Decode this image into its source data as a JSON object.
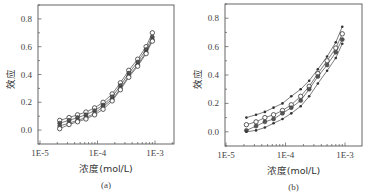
{
  "figure": {
    "panels": [
      {
        "caption": "(a)",
        "xlabel": "浓度(mol/L)",
        "ylabel": "效应"
      },
      {
        "caption": "(b)",
        "xlabel": "浓度(mol/L)",
        "ylabel": "效应"
      }
    ]
  },
  "chart_data": [
    {
      "type": "line",
      "title": "",
      "caption": "(a)",
      "xlabel": "浓度(mol/L)",
      "ylabel": "效应",
      "xscale": "log",
      "xlim": [
        1e-05,
        0.0017
      ],
      "ylim": [
        -0.1,
        0.9
      ],
      "xticks": [
        "1E-5",
        "1E-4",
        "1E-3"
      ],
      "yticks": [
        "0.0",
        "0.2",
        "0.4",
        "0.6",
        "0.8"
      ],
      "grid": false,
      "legend": null,
      "x": [
        2.2e-05,
        3.2e-05,
        4.5e-05,
        6.3e-05,
        8.9e-05,
        0.000125,
        0.00018,
        0.00025,
        0.00035,
        0.0005,
        0.0007,
        0.0009
      ],
      "series": [
        {
          "name": "curve 1 (open circles, upper)",
          "marker": "open-circle",
          "values": [
            0.07,
            0.09,
            0.11,
            0.13,
            0.16,
            0.2,
            0.26,
            0.34,
            0.43,
            0.51,
            0.6,
            0.7
          ]
        },
        {
          "name": "curve 2",
          "marker": "filled-circle",
          "values": [
            0.05,
            0.07,
            0.09,
            0.11,
            0.14,
            0.18,
            0.24,
            0.32,
            0.41,
            0.49,
            0.58,
            0.67
          ]
        },
        {
          "name": "curve 3",
          "marker": "filled-circle",
          "values": [
            0.03,
            0.05,
            0.07,
            0.09,
            0.12,
            0.17,
            0.22,
            0.3,
            0.39,
            0.47,
            0.56,
            0.65
          ]
        },
        {
          "name": "curve 4 (lower)",
          "marker": "open-circle",
          "values": [
            0.01,
            0.04,
            0.06,
            0.08,
            0.11,
            0.15,
            0.21,
            0.29,
            0.38,
            0.46,
            0.55,
            0.64
          ]
        }
      ]
    },
    {
      "type": "line",
      "title": "",
      "caption": "(b)",
      "xlabel": "浓度(mol/L)",
      "ylabel": "效应",
      "xscale": "log",
      "xlim": [
        1e-05,
        0.0016
      ],
      "ylim": [
        -0.1,
        0.9
      ],
      "xticks": [
        "1E-5",
        "1E-4",
        "1E-3"
      ],
      "yticks": [
        "0.0",
        "0.2",
        "0.4",
        "0.6",
        "0.8"
      ],
      "grid": false,
      "legend": null,
      "x": [
        2.2e-05,
        3.2e-05,
        4.5e-05,
        6.3e-05,
        8.9e-05,
        0.000125,
        0.00018,
        0.00025,
        0.00035,
        0.0005,
        0.0007,
        0.0009
      ],
      "series": [
        {
          "name": "curve 1 (top)",
          "marker": "filled-dot",
          "values": [
            0.1,
            0.12,
            0.14,
            0.17,
            0.2,
            0.25,
            0.3,
            0.36,
            0.44,
            0.53,
            0.63,
            0.74
          ]
        },
        {
          "name": "curve 2",
          "marker": "open-circle",
          "values": [
            0.05,
            0.07,
            0.1,
            0.12,
            0.15,
            0.19,
            0.25,
            0.32,
            0.41,
            0.5,
            0.59,
            0.69
          ]
        },
        {
          "name": "curve 3",
          "marker": "filled-circle",
          "values": [
            0.01,
            0.04,
            0.07,
            0.09,
            0.13,
            0.17,
            0.22,
            0.3,
            0.39,
            0.47,
            0.56,
            0.65
          ]
        },
        {
          "name": "curve 4 (bottom)",
          "marker": "filled-dot",
          "values": [
            0.0,
            0.01,
            0.03,
            0.06,
            0.09,
            0.13,
            0.18,
            0.25,
            0.34,
            0.43,
            0.52,
            0.62
          ]
        }
      ]
    }
  ]
}
